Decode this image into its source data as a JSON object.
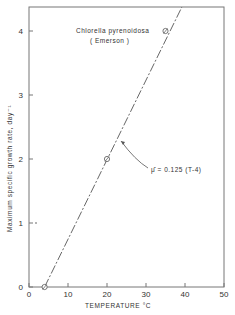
{
  "chart_data": {
    "type": "line",
    "title": "",
    "xlabel": "TEMPERATURE  °C",
    "ylabel": "Maximum specific growth rate, day⁻¹",
    "xlim": [
      0,
      50
    ],
    "ylim": [
      0,
      4.4
    ],
    "xticks": [
      0,
      10,
      20,
      30,
      40,
      50
    ],
    "yticks": [
      0,
      1,
      2,
      3,
      4
    ],
    "xtick_labels": [
      "0",
      "10",
      "20",
      "30",
      "40",
      "50"
    ],
    "ytick_labels": [
      "0",
      "1",
      "2",
      "3",
      "4"
    ],
    "grid": false,
    "legend": null,
    "series": [
      {
        "name": "Chlorella pyrenoidosa (Emerson) data",
        "style": "markers (circle with slash)",
        "x": [
          4,
          20,
          35
        ],
        "y": [
          0,
          2,
          4
        ]
      },
      {
        "name": "Fit: mu_hat = 0.125 (T-4)",
        "style": "dashed line",
        "x": [
          4,
          39.2
        ],
        "y": [
          0,
          4.4
        ]
      }
    ],
    "annotations": [
      {
        "text": "Chlorella  pyrenoidosa",
        "x": 20,
        "y": 4.0
      },
      {
        "text": "(Emerson)",
        "x": 22,
        "y": 3.8
      },
      {
        "text": "μ̂ = 0.125 (T-4)",
        "x": 31,
        "y": 2.0,
        "arrow_to": [
          23.3,
          2.4
        ]
      }
    ]
  },
  "labels": {
    "species": "Chlorella  pyrenoidosa",
    "source": "( Emerson )",
    "equation": "μ̂  =  0.125 (T-4)",
    "xlabel": "TEMPERATURE    °C",
    "ylabel": "Maximum specific growth rate,  day⁻¹"
  }
}
